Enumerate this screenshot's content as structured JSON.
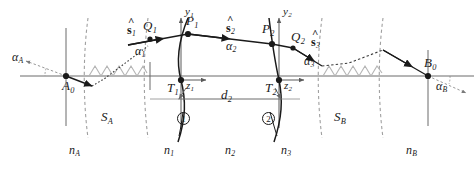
{
  "figure": {
    "type": "ray-tracing-optical-diagram",
    "colors": {
      "ray": "#1a1a1a",
      "axis": "#5a5a5a",
      "boundary_dashed": "#9a9a9a",
      "wave": "#b0b0b0",
      "label": "#1a1a1a"
    }
  },
  "points": [
    {
      "name": "A0",
      "label": "A",
      "sub": "0",
      "x": 66,
      "y": 76
    },
    {
      "name": "Q1",
      "label": "Q",
      "sub": "1",
      "x": 150,
      "y": 39
    },
    {
      "name": "P1",
      "label": "P",
      "sub": "1",
      "x": 188,
      "y": 34
    },
    {
      "name": "P2",
      "label": "P",
      "sub": "2",
      "x": 272,
      "y": 44
    },
    {
      "name": "Q2",
      "label": "Q",
      "sub": "2",
      "x": 293,
      "y": 48
    },
    {
      "name": "T1",
      "label": "T",
      "sub": "1",
      "x": 181,
      "y": 80
    },
    {
      "name": "T2",
      "label": "T",
      "sub": "2",
      "x": 279,
      "y": 80
    },
    {
      "name": "B0",
      "label": "B",
      "sub": "0",
      "x": 428,
      "y": 76
    }
  ],
  "axis_labels": [
    {
      "name": "y1-axis",
      "label": "y",
      "sub": "1",
      "x": 186,
      "y": 12
    },
    {
      "name": "z1-axis",
      "label": "z",
      "sub": "1",
      "x": 195,
      "y": 84
    },
    {
      "name": "y2-axis",
      "label": "y",
      "sub": "2",
      "x": 286,
      "y": 12
    },
    {
      "name": "z2-axis",
      "label": "z",
      "sub": "2",
      "x": 293,
      "y": 84
    }
  ],
  "unit_vectors": [
    {
      "name": "s1-hat",
      "label": "s",
      "sub": "1",
      "x": 128,
      "y": 26
    },
    {
      "name": "s2-hat",
      "label": "s",
      "sub": "2",
      "x": 228,
      "y": 24
    },
    {
      "name": "s3-hat",
      "label": "s",
      "sub": "3",
      "x": 314,
      "y": 38
    }
  ],
  "angles": [
    {
      "name": "alpha-A",
      "label": "α",
      "sub": "A",
      "x": 14,
      "y": 56
    },
    {
      "name": "alpha-1",
      "label": "α",
      "sub": "1",
      "x": 137,
      "y": 48
    },
    {
      "name": "alpha-2",
      "label": "α",
      "sub": "2",
      "x": 228,
      "y": 43
    },
    {
      "name": "alpha-3",
      "label": "α",
      "sub": "3",
      "x": 306,
      "y": 59
    },
    {
      "name": "alpha-B",
      "label": "α",
      "sub": "B",
      "x": 438,
      "y": 85
    }
  ],
  "region_labels": [
    {
      "name": "slab-SA",
      "label": "S",
      "sub": "A",
      "x": 105,
      "y": 117
    },
    {
      "name": "slab-SB",
      "label": "S",
      "sub": "B",
      "x": 338,
      "y": 117
    }
  ],
  "index_labels": [
    {
      "name": "index-nA",
      "label": "n",
      "sub": "A",
      "x": 73,
      "y": 150
    },
    {
      "name": "index-n1",
      "label": "n",
      "sub": "1",
      "x": 168,
      "y": 150
    },
    {
      "name": "index-n2",
      "label": "n",
      "sub": "2",
      "x": 229,
      "y": 150
    },
    {
      "name": "index-n3",
      "label": "n",
      "sub": "3",
      "x": 285,
      "y": 150
    },
    {
      "name": "index-nB",
      "label": "n",
      "sub": "B",
      "x": 410,
      "y": 150
    }
  ],
  "dimension": {
    "name": "thickness-d2",
    "label": "d",
    "sub": "2",
    "x": 224,
    "y": 106
  },
  "surface_numbers": [
    {
      "name": "surface-1",
      "label": "1",
      "x": 183,
      "y": 119
    },
    {
      "name": "surface-2",
      "label": "2",
      "x": 268,
      "y": 119
    }
  ]
}
